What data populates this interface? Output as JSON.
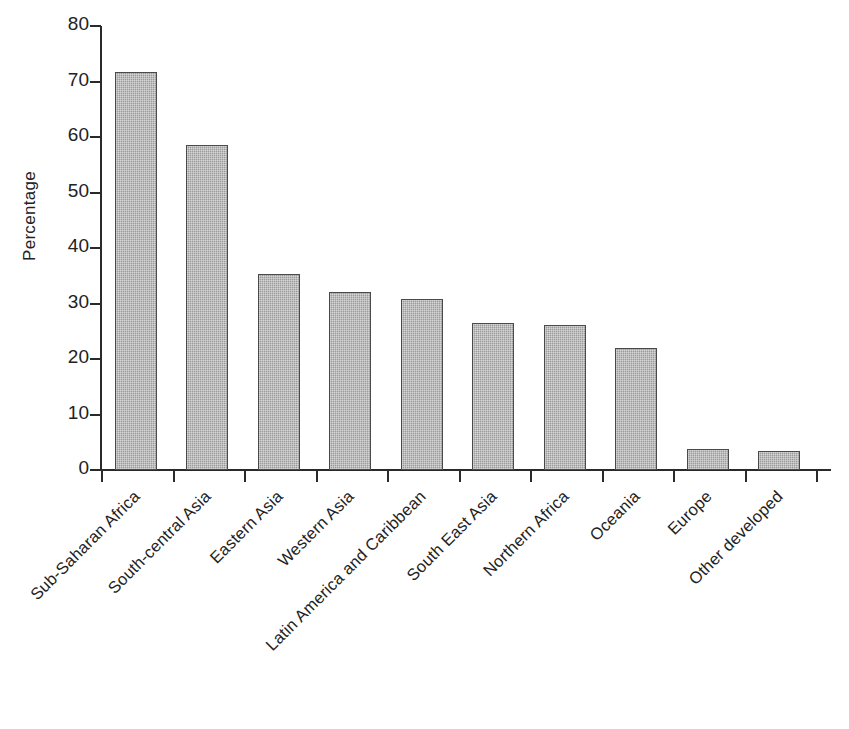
{
  "chart_data": {
    "type": "bar",
    "title": "",
    "xlabel": "",
    "ylabel": "Percentage",
    "ylim": [
      0,
      80
    ],
    "yticks": [
      0,
      10,
      20,
      30,
      40,
      50,
      60,
      70,
      80
    ],
    "grid": false,
    "legend": "none",
    "categories": [
      "Sub-Saharan Africa",
      "South-central Asia",
      "Eastern Asia",
      "Western Asia",
      "Latin America and Caribbean",
      "South East Asia",
      "Northern Africa",
      "Oceania",
      "Europe",
      "Other developed"
    ],
    "values": [
      71.8,
      58.6,
      35.3,
      32.0,
      30.8,
      26.5,
      26.2,
      22.0,
      3.7,
      3.4
    ],
    "bar_color": "#9b9b9b",
    "bar_border_color": "#4a4a4a",
    "axis_color": "#2a2a2a",
    "background_color": "#ffffff"
  }
}
